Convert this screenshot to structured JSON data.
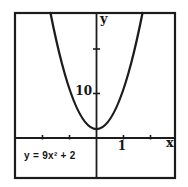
{
  "chart_data": {
    "type": "line",
    "subtype": "function-plot",
    "equation_text": "y = 9x² + 2",
    "coefficients": {
      "a": 9,
      "b": 0,
      "c": 2
    },
    "xlabel": "x",
    "ylabel": "y",
    "x_ticks": [
      -2,
      -1,
      1,
      2
    ],
    "y_ticks": [
      10,
      20
    ],
    "labeled_x_tick": {
      "value": 1,
      "label": "1"
    },
    "labeled_y_tick": {
      "value": 10,
      "label": "10"
    },
    "xlim": [
      -3,
      3
    ],
    "ylim": [
      -8.5,
      28.5
    ],
    "grid": false,
    "legend": false,
    "curve_points": [
      {
        "x": -1.7,
        "y": 28.01
      },
      {
        "x": -1.5,
        "y": 22.25
      },
      {
        "x": -1.0,
        "y": 11.0
      },
      {
        "x": -0.5,
        "y": 4.25
      },
      {
        "x": 0.0,
        "y": 2.0
      },
      {
        "x": 0.5,
        "y": 4.25
      },
      {
        "x": 1.0,
        "y": 11.0
      },
      {
        "x": 1.5,
        "y": 22.25
      },
      {
        "x": 1.7,
        "y": 28.01
      }
    ],
    "colors": {
      "curve": "#1c1c1c",
      "axis": "#1c1c1c",
      "frame": "#1c1c1c",
      "background": "#ffffff"
    }
  }
}
